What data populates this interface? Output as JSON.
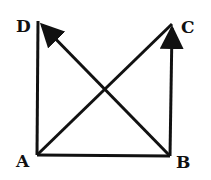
{
  "diagram": {
    "points": {
      "A": {
        "label": "A",
        "x": 37,
        "y": 155
      },
      "B": {
        "label": "B",
        "x": 170,
        "y": 156
      },
      "C": {
        "label": "C",
        "x": 172,
        "y": 24
      },
      "D": {
        "label": "D",
        "x": 38,
        "y": 21
      }
    },
    "edges": [
      {
        "from": "A",
        "to": "D",
        "arrow": false
      },
      {
        "from": "A",
        "to": "B",
        "arrow": false
      },
      {
        "from": "B",
        "to": "C",
        "arrow": true
      },
      {
        "from": "A",
        "to": "C",
        "arrow": false
      },
      {
        "from": "B",
        "to": "D",
        "arrow": true
      }
    ],
    "colors": {
      "stroke": "#111111",
      "background": "#ffffff"
    }
  }
}
